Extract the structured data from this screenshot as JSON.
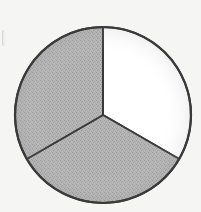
{
  "figure": {
    "kind": "pie-chart",
    "background_color": "#f5f5f3",
    "outline_color": "#3a3a3a",
    "outline_width": 2,
    "center_x": 103,
    "center_y": 115,
    "radius": 88,
    "artifact_label": "scan edge mark"
  },
  "chart_data": {
    "type": "pie",
    "title": "",
    "subtitle": "",
    "xlabel": "",
    "ylabel": "",
    "grid": false,
    "legend_position": "none",
    "start_angle_deg": 90,
    "direction": "clockwise",
    "categories": [
      "Sector 1",
      "Sector 2",
      "Sector 3"
    ],
    "values": [
      33.3,
      33.3,
      33.3
    ],
    "percentages": [
      "33.3%",
      "33.3%",
      "33.3%"
    ],
    "slice_angles_deg": [
      120,
      120,
      120
    ],
    "slices": [
      {
        "name": "Sector 1",
        "value": 33.3,
        "angle_deg": 120,
        "start_deg": 90,
        "end_deg": 330,
        "fill": "#ffffff",
        "fill_style": "plain",
        "position": "right"
      },
      {
        "name": "Sector 2",
        "value": 33.3,
        "angle_deg": 120,
        "start_deg": 330,
        "end_deg": 210,
        "fill": "#b0b0b0",
        "fill_style": "stippled",
        "position": "bottom"
      },
      {
        "name": "Sector 3",
        "value": 33.3,
        "angle_deg": 120,
        "start_deg": 210,
        "end_deg": 90,
        "fill": "#b0b0b0",
        "fill_style": "stippled",
        "position": "upper-left"
      }
    ],
    "annotations": []
  }
}
